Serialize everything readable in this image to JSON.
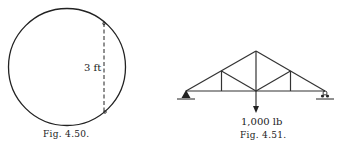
{
  "figures": [
    {
      "id": "fig-4-50",
      "caption": "Fig. 4.50.",
      "dimension_label": "3 ft",
      "description": "Circle with a dashed vertical chord"
    },
    {
      "id": "fig-4-51",
      "caption": "Fig. 4.51.",
      "load_label": "1,000 lb",
      "description": "Roof truss with pinned left support and roller right support, downward load at bottom center"
    }
  ],
  "colors": {
    "ink": "#222222",
    "background": "#ffffff"
  }
}
